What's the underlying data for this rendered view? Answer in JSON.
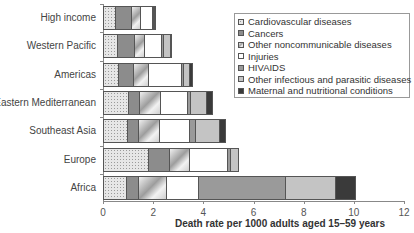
{
  "chart_data": {
    "type": "bar",
    "orientation": "horizontal",
    "stacked": true,
    "title": "",
    "xlabel": "Death rate per 1000 adults aged 15–59 years",
    "ylabel": "",
    "xlim": [
      0,
      12
    ],
    "xticks": [
      "0",
      "2",
      "4",
      "6",
      "8",
      "10",
      "12"
    ],
    "grid": false,
    "legend_position": "upper right",
    "categories": [
      "High income",
      "Western Pacific",
      "Americas",
      "Eastern Mediterranean",
      "Southeast Asia",
      "Europe",
      "Africa"
    ],
    "series": [
      {
        "name": "Cardiovascular diseases",
        "values": [
          0.52,
          0.6,
          0.65,
          1.04,
          1.0,
          1.83,
          0.96
        ]
      },
      {
        "name": "Cancers",
        "values": [
          0.64,
          0.68,
          0.6,
          0.44,
          0.44,
          0.84,
          0.48
        ]
      },
      {
        "name": "Other noncommunicable diseases",
        "values": [
          0.36,
          0.39,
          0.6,
          0.83,
          0.83,
          0.8,
          1.11
        ]
      },
      {
        "name": "Injuries",
        "values": [
          0.48,
          0.7,
          1.3,
          1.06,
          1.2,
          1.51,
          1.28
        ]
      },
      {
        "name": "HIVAIDS",
        "values": [
          0.02,
          0.05,
          0.1,
          0.14,
          0.23,
          0.12,
          3.47
        ]
      },
      {
        "name": "Other infectious and parasitic diseases",
        "values": [
          0.04,
          0.3,
          0.2,
          0.64,
          0.97,
          0.32,
          1.99
        ]
      },
      {
        "name": "Maternal and nutritional conditions",
        "values": [
          0.02,
          0.02,
          0.12,
          0.24,
          0.23,
          0.0,
          0.79
        ]
      }
    ]
  },
  "colors": {
    "axis": "#888888",
    "maternal": "#3a3a3a",
    "hiv": "#9a9a9a",
    "cancers": "#8c8c8c",
    "other_infectious": "#c4c4c4"
  }
}
